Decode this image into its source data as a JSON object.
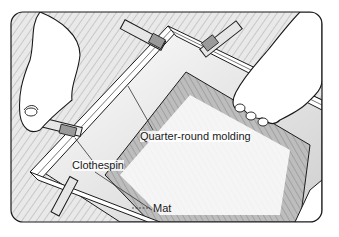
{
  "illustration": {
    "subject": "Hands clamping quarter-round molding around a mat with clothespins",
    "labels": {
      "molding": "Quarter-round molding",
      "clothespin": "Clothespin",
      "mat": "Mat"
    }
  },
  "colors": {
    "line": "#1a1a1a",
    "background": "#ffffff",
    "hatch": "#555555"
  }
}
